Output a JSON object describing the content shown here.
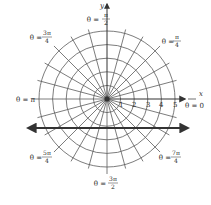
{
  "diagram": {
    "type": "polar-coordinate-grid",
    "center": {
      "x": 107,
      "y": 99
    },
    "radius_unit_px": 13.6,
    "rings": [
      1,
      2,
      3,
      4,
      5
    ],
    "spoke_step_degrees": 15,
    "colors": {
      "grid": "#5a5a5a",
      "axes": "#333333",
      "bold_line": "#333333",
      "text": "#2a2a2a",
      "background": "#ffffff"
    },
    "axes": {
      "x_label": "x",
      "y_label": "y"
    },
    "radial_ticks": [
      "1",
      "2",
      "3",
      "4",
      "5"
    ],
    "angle_labels": [
      {
        "id": "theta-0",
        "prefix": "θ = ",
        "value": "0"
      },
      {
        "id": "theta-pi-4",
        "prefix": "θ = ",
        "num": "π",
        "den": "4"
      },
      {
        "id": "theta-pi-2",
        "prefix": "θ = ",
        "num": "π",
        "den": "2"
      },
      {
        "id": "theta-3pi-4",
        "prefix": "θ = ",
        "num": "3π",
        "den": "4"
      },
      {
        "id": "theta-pi",
        "prefix": "θ = ",
        "value": "π"
      },
      {
        "id": "theta-5pi-4",
        "prefix": "θ = ",
        "num": "5π",
        "den": "4"
      },
      {
        "id": "theta-3pi-2",
        "prefix": "θ = ",
        "num": "3π",
        "den": "2"
      },
      {
        "id": "theta-7pi-4",
        "prefix": "θ = ",
        "num": "7π",
        "den": "4"
      }
    ],
    "horizontal_line": {
      "y_px": 128,
      "x_start_px": 25,
      "x_end_px": 190,
      "arrows": "both"
    }
  }
}
